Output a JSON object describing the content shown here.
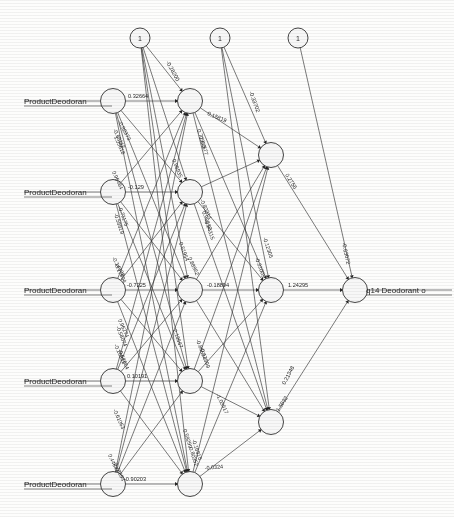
{
  "diagram": {
    "type": "neural-network",
    "layers": [
      {
        "name": "input",
        "count": 5,
        "x": 113
      },
      {
        "name": "hidden1",
        "count": 5,
        "x": 190
      },
      {
        "name": "hidden2",
        "count": 3,
        "x": 271
      },
      {
        "name": "output",
        "count": 1,
        "x": 355
      }
    ],
    "bias_nodes": [
      {
        "label": "1",
        "x": 140,
        "y": 38
      },
      {
        "label": "1",
        "x": 220,
        "y": 38
      },
      {
        "label": "1",
        "x": 298,
        "y": 38
      }
    ],
    "input_labels": [
      "ProductDeodoran",
      "ProductDeodoran",
      "ProductDeodoran",
      "ProductDeodoran",
      "ProductDeodoran"
    ],
    "output_label": "q14 Deodorant o",
    "input_node_y": [
      101,
      192,
      290,
      381,
      484
    ],
    "hidden1_node_y": [
      101,
      192,
      290,
      381,
      484
    ],
    "hidden2_node_y": [
      155,
      290,
      422
    ],
    "output_node_y": [
      290
    ],
    "horizontal_weights": [
      {
        "value": "0.32664",
        "x": 128,
        "y": 98
      },
      {
        "value": "-0.129",
        "x": 128,
        "y": 189
      },
      {
        "value": "-0.7225",
        "x": 127,
        "y": 287
      },
      {
        "value": "0.10191",
        "x": 127,
        "y": 378
      },
      {
        "value": "-0.90203",
        "x": 124,
        "y": 481
      }
    ],
    "mid_weights": [
      {
        "value": "-0.18894",
        "x": 207,
        "y": 287
      },
      {
        "value": "1.24295",
        "x": 288,
        "y": 287
      },
      {
        "value": "0.15819",
        "x": 207,
        "y": 115
      },
      {
        "value": "0.2756",
        "x": 285,
        "y": 175
      },
      {
        "value": "0.21348",
        "x": 285,
        "y": 385
      },
      {
        "value": "1.5032",
        "x": 279,
        "y": 412
      },
      {
        "value": "-0.28200",
        "x": 166,
        "y": 62
      },
      {
        "value": "-0.33702",
        "x": 249,
        "y": 92
      },
      {
        "value": "-0.63072",
        "x": 342,
        "y": 243
      }
    ],
    "cluster_weights": [
      {
        "value": "-0.92373",
        "x": 118,
        "y": 122
      },
      {
        "value": "-0.68112",
        "x": 113,
        "y": 130
      },
      {
        "value": "1.05618",
        "x": 114,
        "y": 137
      },
      {
        "value": "0.96464",
        "x": 112,
        "y": 172
      },
      {
        "value": "-0.71175",
        "x": 118,
        "y": 207
      },
      {
        "value": "-0.58819",
        "x": 114,
        "y": 214
      },
      {
        "value": "0.96935",
        "x": 172,
        "y": 160
      },
      {
        "value": "0.77913",
        "x": 197,
        "y": 130
      },
      {
        "value": "0.44677",
        "x": 199,
        "y": 137
      },
      {
        "value": "0.98252",
        "x": 202,
        "y": 212
      },
      {
        "value": "-0.94315",
        "x": 204,
        "y": 220
      },
      {
        "value": "-0.80314",
        "x": 200,
        "y": 200
      },
      {
        "value": "0.51954",
        "x": 179,
        "y": 243
      },
      {
        "value": "-0.12305",
        "x": 263,
        "y": 238
      },
      {
        "value": "-0.14908",
        "x": 112,
        "y": 258
      },
      {
        "value": "-0.17894",
        "x": 114,
        "y": 264
      },
      {
        "value": "0.88952",
        "x": 188,
        "y": 258
      },
      {
        "value": "-0.31005",
        "x": 255,
        "y": 258
      },
      {
        "value": "0.96274",
        "x": 118,
        "y": 320
      },
      {
        "value": "-0.58074",
        "x": 116,
        "y": 327
      },
      {
        "value": "-0.10812",
        "x": 114,
        "y": 345
      },
      {
        "value": "-0.64664",
        "x": 118,
        "y": 350
      },
      {
        "value": "2.13567",
        "x": 173,
        "y": 330
      },
      {
        "value": "-0.86594",
        "x": 196,
        "y": 340
      },
      {
        "value": "-0.17899",
        "x": 200,
        "y": 348
      },
      {
        "value": "-1.03517",
        "x": 216,
        "y": 395
      },
      {
        "value": "-0.61063",
        "x": 113,
        "y": 410
      },
      {
        "value": "0.59299",
        "x": 183,
        "y": 430
      },
      {
        "value": "-0.16815",
        "x": 192,
        "y": 440
      },
      {
        "value": "0.80352",
        "x": 189,
        "y": 448
      },
      {
        "value": "0.44641",
        "x": 108,
        "y": 455
      },
      {
        "value": "-0.78694",
        "x": 113,
        "y": 462
      },
      {
        "value": "-0.0324",
        "x": 205,
        "y": 470
      }
    ]
  }
}
